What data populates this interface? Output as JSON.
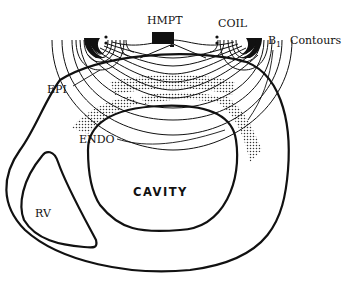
{
  "figure": {
    "labels": {
      "hmpt": "HMPT",
      "coil": "COIL",
      "b1": "B",
      "b1_sub": "1",
      "contours": "Contours",
      "epi": "EPI",
      "endo": "ENDO",
      "cavity": "CAVITY",
      "rv": "RV"
    },
    "colors": {
      "ink": "#111111",
      "background": "#ffffff",
      "stipple": "#333333"
    }
  }
}
